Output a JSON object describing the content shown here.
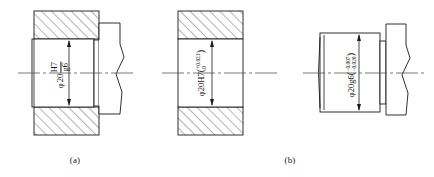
{
  "drawing": {
    "title": "Shaft-hole fit tolerance section views",
    "background_color": "#ffffff",
    "line_color": "#1a1a1a",
    "hatch_color": "#2a2a2a",
    "centerline_color": "#555555"
  },
  "figures": [
    {
      "id": "figure-a",
      "caption": "(a)",
      "description": "Assembled hole and shaft section, hatched housing",
      "dimension": {
        "kind": "fit",
        "diameter_symbol": "φ",
        "nominal": "20",
        "hole_tolerance": "H7",
        "shaft_tolerance": "g6",
        "full_text": "φ20 H7/g6"
      }
    },
    {
      "id": "figure-hole",
      "caption": "",
      "description": "Hole only, full section with hatching",
      "dimension": {
        "kind": "hole",
        "diameter_symbol": "φ",
        "nominal": "20",
        "tolerance_class": "H7",
        "upper_deviation": "+0.021",
        "lower_deviation": "0",
        "open_paren": "(",
        "close_paren": ")",
        "full_text": "φ20H7(+0.021 / 0)"
      }
    },
    {
      "id": "figure-b",
      "caption": "(b)",
      "description": "Shaft only, outside view with break line",
      "dimension": {
        "kind": "shaft",
        "diameter_symbol": "φ",
        "nominal": "20",
        "tolerance_class": "g6",
        "upper_deviation": "−0.007",
        "lower_deviation": "−0.020",
        "open_paren": "(",
        "close_paren": ")",
        "full_text": "φ20g6(−0.007 / −0.020)"
      }
    }
  ]
}
